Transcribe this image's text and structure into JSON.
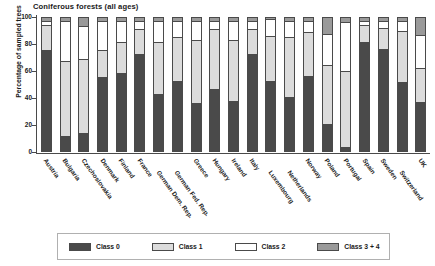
{
  "chart_data": {
    "type": "bar",
    "subtype": "stacked-bar-100-percent",
    "title": "Coniferous forests (all ages)",
    "xlabel": "",
    "ylabel": "Percentage of sampled trees",
    "ylim": [
      0,
      100
    ],
    "yticks": [
      0,
      20,
      40,
      60,
      80,
      100
    ],
    "grid": false,
    "legend_position": "bottom",
    "categories": [
      "Austria",
      "Bulgaria",
      "Czechoslovakia",
      "Denmark",
      "Finland",
      "France",
      "German Dem. Rep.",
      "German Fed. Rep.",
      "Greece",
      "Hungary",
      "Ireland",
      "Italy",
      "Luxembourg",
      "Netherlands",
      "Norway",
      "Poland",
      "Portugal",
      "Spain",
      "Sweden",
      "Switzerland",
      "UK"
    ],
    "series": [
      {
        "name": "Class 0",
        "color": "#4a4a4a",
        "values": [
          77,
          11,
          13,
          56,
          59,
          74,
          43,
          53,
          36,
          47,
          38,
          74,
          53,
          41,
          57,
          20,
          2,
          83,
          78,
          52,
          37
        ]
      },
      {
        "name": "Class 1",
        "color": "#dcdcdc",
        "values": [
          18,
          57,
          56,
          20,
          23,
          18,
          39,
          33,
          48,
          45,
          46,
          18,
          34,
          45,
          33,
          45,
          58,
          12,
          15,
          39,
          25
        ]
      },
      {
        "name": "Class 2",
        "color": "#ffffff",
        "values": [
          3,
          30,
          25,
          22,
          16,
          6,
          16,
          12,
          14,
          6,
          14,
          6,
          12,
          12,
          8,
          23,
          37,
          3,
          5,
          7,
          25
        ]
      },
      {
        "name": "Class 3 + 4",
        "color": "#9a9a9a",
        "values": [
          2,
          2,
          6,
          2,
          2,
          2,
          2,
          2,
          2,
          2,
          2,
          2,
          1,
          2,
          2,
          12,
          3,
          2,
          2,
          2,
          13
        ]
      }
    ]
  },
  "legend": {
    "items": [
      {
        "label": "Class 0",
        "swatch": "class-0-swatch"
      },
      {
        "label": "Class 1",
        "swatch": "class-1-swatch"
      },
      {
        "label": "Class 2",
        "swatch": "class-2-swatch"
      },
      {
        "label": "Class 3 + 4",
        "swatch": "class-3-4-swatch"
      }
    ]
  },
  "axis": {
    "y_title": "Percentage of sampled trees",
    "y_tick_labels": [
      "100",
      "80",
      "60",
      "40",
      "20",
      "0"
    ]
  },
  "colors": {
    "class0": "#4a4a4a",
    "class1": "#dcdcdc",
    "class2": "#ffffff",
    "class3_4": "#9a9a9a",
    "axis": "#4a4a4a",
    "text": "#1a1a1a",
    "background": "#ffffff"
  }
}
